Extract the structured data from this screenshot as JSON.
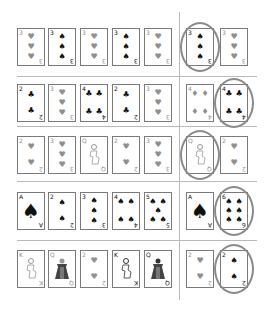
{
  "puzzle": {
    "rows": [
      {
        "sequence": [
          {
            "rank": "3",
            "suit": "hearts",
            "tone": "gray"
          },
          {
            "rank": "3",
            "suit": "spades",
            "tone": "black"
          },
          {
            "rank": "3",
            "suit": "hearts",
            "tone": "gray"
          },
          {
            "rank": "3",
            "suit": "spades",
            "tone": "black"
          },
          {
            "rank": "3",
            "suit": "hearts",
            "tone": "gray"
          }
        ],
        "options": [
          {
            "rank": "3",
            "suit": "spades",
            "tone": "black",
            "circled": true
          },
          {
            "rank": "3",
            "suit": "hearts",
            "tone": "gray",
            "circled": false
          }
        ]
      },
      {
        "sequence": [
          {
            "rank": "2",
            "suit": "clubs",
            "tone": "black"
          },
          {
            "rank": "3",
            "suit": "hearts",
            "tone": "gray"
          },
          {
            "rank": "4",
            "suit": "clubs",
            "tone": "black"
          },
          {
            "rank": "2",
            "suit": "clubs",
            "tone": "black"
          },
          {
            "rank": "3",
            "suit": "hearts",
            "tone": "gray"
          }
        ],
        "options": [
          {
            "rank": "4",
            "suit": "diamonds",
            "tone": "gray",
            "circled": false
          },
          {
            "rank": "4",
            "suit": "clubs",
            "tone": "black",
            "circled": true
          }
        ]
      },
      {
        "sequence": [
          {
            "rank": "2",
            "suit": "hearts",
            "tone": "gray"
          },
          {
            "rank": "3",
            "suit": "hearts",
            "tone": "gray"
          },
          {
            "rank": "Q",
            "suit": "hearts",
            "tone": "gray",
            "face": "light"
          },
          {
            "rank": "2",
            "suit": "hearts",
            "tone": "gray"
          },
          {
            "rank": "3",
            "suit": "hearts",
            "tone": "gray"
          }
        ],
        "options": [
          {
            "rank": "Q",
            "suit": "hearts",
            "tone": "gray",
            "face": "light",
            "circled": true
          },
          {
            "rank": "2",
            "suit": "hearts",
            "tone": "gray",
            "circled": false
          }
        ]
      },
      {
        "sequence": [
          {
            "rank": "A",
            "suit": "spades",
            "tone": "black"
          },
          {
            "rank": "2",
            "suit": "spades",
            "tone": "black"
          },
          {
            "rank": "3",
            "suit": "spades",
            "tone": "black"
          },
          {
            "rank": "4",
            "suit": "spades",
            "tone": "black"
          },
          {
            "rank": "5",
            "suit": "spades",
            "tone": "black"
          }
        ],
        "options": [
          {
            "rank": "A",
            "suit": "spades",
            "tone": "black",
            "circled": false
          },
          {
            "rank": "6",
            "suit": "spades",
            "tone": "black",
            "circled": true
          }
        ]
      },
      {
        "sequence": [
          {
            "rank": "K",
            "suit": "hearts",
            "tone": "gray",
            "face": "light"
          },
          {
            "rank": "Q",
            "suit": "hearts",
            "tone": "gray",
            "face": "dark"
          },
          {
            "rank": "2",
            "suit": "hearts",
            "tone": "gray"
          },
          {
            "rank": "K",
            "suit": "spades",
            "tone": "black",
            "face": "light"
          },
          {
            "rank": "Q",
            "suit": "spades",
            "tone": "black",
            "face": "dark"
          }
        ],
        "options": [
          {
            "rank": "2",
            "suit": "hearts",
            "tone": "gray",
            "circled": false
          },
          {
            "rank": "2",
            "suit": "spades",
            "tone": "black",
            "circled": true
          }
        ]
      }
    ]
  },
  "suit_glyphs": {
    "hearts": "♥",
    "spades": "♠",
    "clubs": "♣",
    "diamonds": "♦"
  },
  "colors": {
    "circle": "#8a8a8a",
    "line": "#b9b9b9",
    "black_pip": "#111111",
    "gray_pip": "#8f8f8f"
  }
}
